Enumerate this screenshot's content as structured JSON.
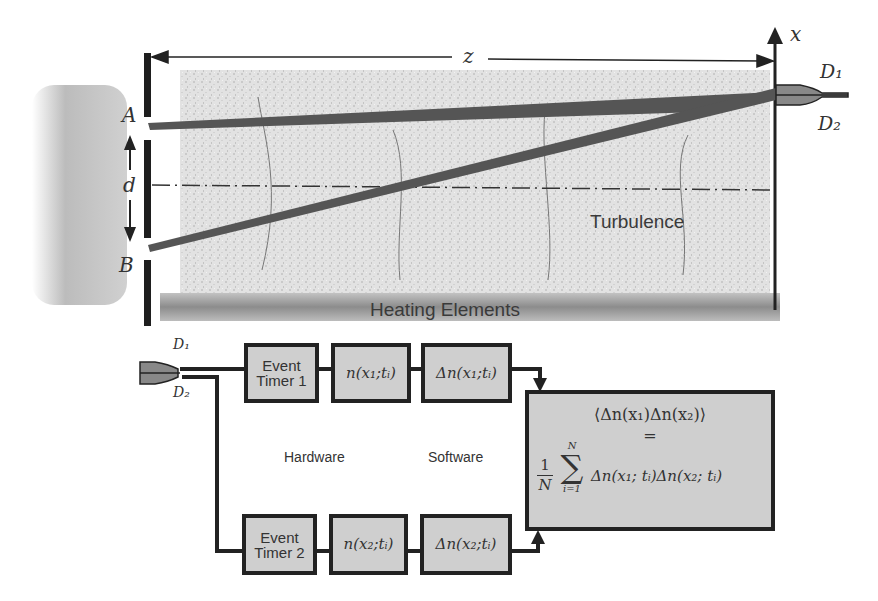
{
  "diagram": {
    "top": {
      "distance_label": "z",
      "axis_label": "x",
      "aperture_a_label": "A",
      "aperture_b_label": "B",
      "separation_label": "d",
      "detector_1_label": "D₁",
      "detector_2_label": "D₂",
      "turbulence_label": "Turbulence",
      "heater_label": "Heating Elements"
    },
    "bottom": {
      "detector_1_label": "D₁",
      "detector_2_label": "D₂",
      "timer_1_line1": "Event",
      "timer_1_line2": "Timer 1",
      "timer_2_line1": "Event",
      "timer_2_line2": "Timer 2",
      "n1": "n(x₁;tᵢ)",
      "dn1": "Δn(x₁;tᵢ)",
      "n2": "n(x₂;tᵢ)",
      "dn2": "Δn(x₂;tᵢ)",
      "hardware_label": "Hardware",
      "software_label": "Software",
      "result_lhs": "⟨Δn(x₁)Δn(x₂)⟩",
      "result_eq": "=",
      "result_frac_num": "1",
      "result_frac_den": "N",
      "result_sum_top": "N",
      "result_sum_bottom": "i=1",
      "result_sum_symbol": "∑",
      "result_rhs": "Δn(x₁; tᵢ)Δn(x₂; tᵢ)"
    },
    "colors": {
      "line": "#222222",
      "beam": "#5a5a5a",
      "box_fill": "#cfcfcf",
      "turbulence_fill": "#e4e4e4",
      "heater_fill": "#8a8a8a",
      "source_glow": "#b8b8b8"
    }
  }
}
